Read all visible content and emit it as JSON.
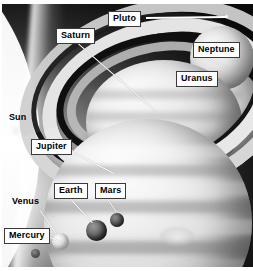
{
  "image": {
    "title": "Solar system planets size comparison montage",
    "background_color": "#0b0b0b",
    "label_box_color": "#ffffff",
    "leader_line_color": "#ffffff",
    "width": 253,
    "height": 271
  },
  "labels": [
    {
      "id": "pluto",
      "text": "Pluto",
      "style": "boxed",
      "x": 108,
      "y": 11,
      "leader": {
        "x1": 146,
        "y1": 17,
        "x2": 226,
        "y2": 16
      }
    },
    {
      "id": "neptune",
      "text": "Neptune",
      "style": "boxed",
      "x": 193,
      "y": 42,
      "leader": {
        "x1": 206,
        "y1": 57,
        "x2": 226,
        "y2": 67
      }
    },
    {
      "id": "uranus",
      "text": "Uranus",
      "style": "boxed",
      "x": 176,
      "y": 71,
      "leader": null
    },
    {
      "id": "saturn",
      "text": "Saturn",
      "style": "boxed",
      "x": 56,
      "y": 28,
      "leader": {
        "x1": 78,
        "y1": 43,
        "x2": 156,
        "y2": 111
      }
    },
    {
      "id": "sun",
      "text": "Sun",
      "style": "plain",
      "x": 9,
      "y": 113,
      "leader": null
    },
    {
      "id": "jupiter",
      "text": "Jupiter",
      "style": "boxed",
      "x": 31,
      "y": 139,
      "leader": {
        "x1": 69,
        "y1": 150,
        "x2": 114,
        "y2": 173
      }
    },
    {
      "id": "earth",
      "text": "Earth",
      "style": "boxed",
      "x": 54,
      "y": 183,
      "leader": {
        "x1": 70,
        "y1": 198,
        "x2": 92,
        "y2": 222
      }
    },
    {
      "id": "mars",
      "text": "Mars",
      "style": "boxed",
      "x": 95,
      "y": 183,
      "leader": {
        "x1": 107,
        "y1": 198,
        "x2": 116,
        "y2": 211
      }
    },
    {
      "id": "venus",
      "text": "Venus",
      "style": "plain",
      "x": 12,
      "y": 197,
      "leader": {
        "x1": 40,
        "y1": 210,
        "x2": 56,
        "y2": 233
      }
    },
    {
      "id": "mercury",
      "text": "Mercury",
      "style": "boxed",
      "x": 4,
      "y": 228,
      "leader": {
        "x1": 48,
        "y1": 236,
        "x2": 62,
        "y2": 242
      }
    }
  ],
  "bodies": [
    {
      "id": "sun",
      "name": "Sun"
    },
    {
      "id": "jupiter",
      "name": "Jupiter"
    },
    {
      "id": "saturn",
      "name": "Saturn"
    },
    {
      "id": "uranus",
      "name": "Uranus"
    },
    {
      "id": "neptune",
      "name": "Neptune"
    },
    {
      "id": "earth",
      "name": "Earth"
    },
    {
      "id": "venus",
      "name": "Venus"
    },
    {
      "id": "mars",
      "name": "Mars"
    },
    {
      "id": "mercury",
      "name": "Mercury"
    },
    {
      "id": "pluto",
      "name": "Pluto"
    }
  ]
}
